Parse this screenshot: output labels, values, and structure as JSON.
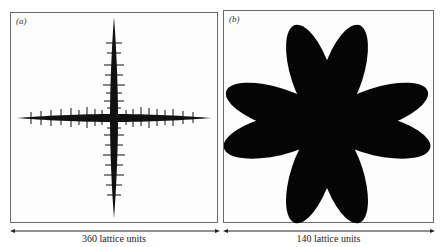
{
  "figure": {
    "panels": [
      {
        "id": "a",
        "label": "(a)",
        "description": "Needle-like cross-shaped dendritic cluster with four thin arms and side branches",
        "scale_label": "360 lattice units",
        "fill_color": "#111111"
      },
      {
        "id": "b",
        "label": "(b)",
        "description": "Eight-petaled flower-like compact cluster",
        "scale_label": "140 lattice units",
        "fill_color": "#050505"
      }
    ],
    "border_color": "#6a6a6a",
    "background_color": "#ffffff"
  }
}
